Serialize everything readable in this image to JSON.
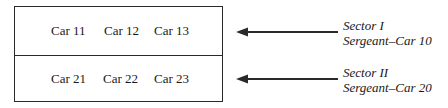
{
  "diagram": {
    "rows": [
      {
        "cars": [
          "Car 11",
          "Car 12",
          "Car 13"
        ],
        "sector": "Sector I",
        "sergeant": "Sergeant–Car 10"
      },
      {
        "cars": [
          "Car 21",
          "Car 22",
          "Car 23"
        ],
        "sector": "Sector II",
        "sergeant": "Sergeant–Car 20"
      }
    ],
    "colors": {
      "line": "#2a2a2a",
      "text": "#1a1a1a",
      "background": "#ffffff"
    }
  }
}
